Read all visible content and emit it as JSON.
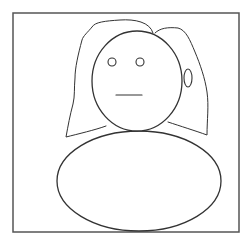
{
  "figure": {
    "description": "Simple line drawing of a person with long hair, round head, and oval body",
    "colors": {
      "background": "#ffffff",
      "stroke": "#333333",
      "frame": "#555555"
    },
    "frame": {
      "x": 13,
      "y": 13,
      "width": 226,
      "height": 219
    },
    "hair": {
      "left_path": "M 153 33 C 150 22, 135 19, 120 20 C 105 21, 95 22, 92 27 C 88 32, 83 36, 82 40 C 78 55, 75 68, 75 78 C 74 88, 75 96, 73 104 C 70 115, 68 126, 66 137 C 78 134, 95 130, 106 126",
      "right_path": "M 155 33 C 160 28, 168 27, 178 28 C 186 30, 190 40, 195 52 C 200 64, 205 78, 207 92 C 209 106, 207 120, 207 135 C 196 131, 180 126, 168 122"
    },
    "head": {
      "cx": 137,
      "cy": 81,
      "rx": 45,
      "ry": 50
    },
    "eyes": [
      {
        "cx": 112,
        "cy": 62,
        "r": 4
      },
      {
        "cx": 140,
        "cy": 62,
        "r": 4
      }
    ],
    "mouth": {
      "x1": 116,
      "y1": 95,
      "x2": 142,
      "y2": 95
    },
    "ear": {
      "cx": 188,
      "cy": 78,
      "rx": 4,
      "ry": 9
    },
    "body": {
      "cx": 139,
      "cy": 181,
      "rx": 82,
      "ry": 50
    }
  }
}
